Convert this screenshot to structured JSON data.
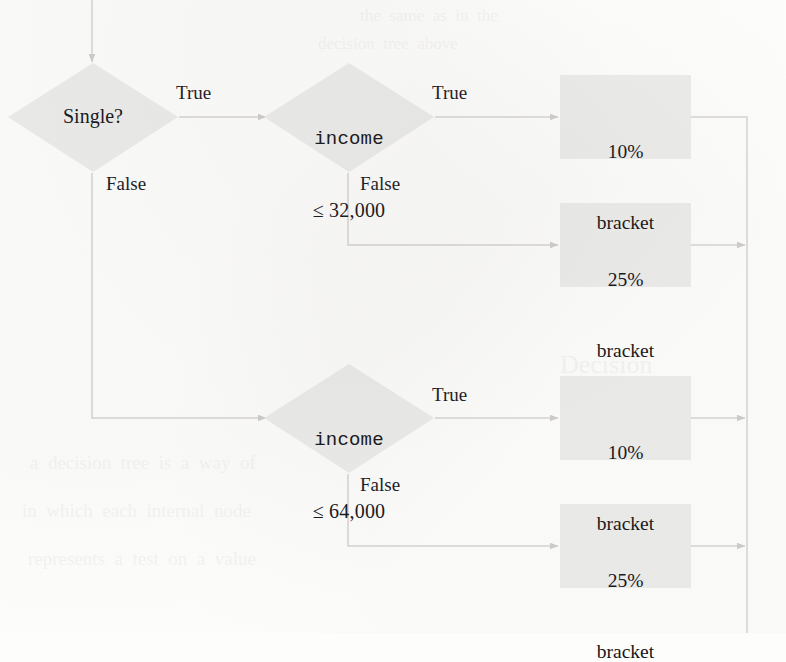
{
  "figure": {
    "kind": "decision-tree-flowchart",
    "colors": {
      "node_fill": "#ececea",
      "edge_line": "#d6d4d2",
      "text": "#17161a",
      "page_background": "#fdfdfc"
    }
  },
  "nodes": {
    "root": {
      "id": "single",
      "shape": "diamond",
      "label": "Single?"
    },
    "income_top": {
      "id": "income-32000",
      "shape": "diamond",
      "label_line1": "income",
      "label_line2": "≤ 32,000"
    },
    "income_bottom": {
      "id": "income-64000",
      "shape": "diamond",
      "label_line1": "income",
      "label_line2": "≤ 64,000"
    },
    "leaf_a": {
      "id": "bracket-10-top",
      "shape": "rect",
      "label_line1": "10%",
      "label_line2": "bracket"
    },
    "leaf_b": {
      "id": "bracket-25-top",
      "shape": "rect",
      "label_line1": "25%",
      "label_line2": "bracket"
    },
    "leaf_c": {
      "id": "bracket-10-bottom",
      "shape": "rect",
      "label_line1": "10%",
      "label_line2": "bracket"
    },
    "leaf_d": {
      "id": "bracket-25-bottom",
      "shape": "rect",
      "label_line1": "25%",
      "label_line2": "bracket"
    }
  },
  "edges": {
    "single_true": "True",
    "single_false": "False",
    "income_top_true": "True",
    "income_top_false": "False",
    "income_bottom_true": "True",
    "income_bottom_false": "False"
  },
  "ghost_text": {
    "g1": "the  same  as  in  the",
    "g2": "decision  tree  above",
    "g3": "Decision",
    "g4": "a  decision  tree  is  a  way  of",
    "g5": "in  which  each  internal  node",
    "g6": "represents  a  test  on  a  value"
  }
}
